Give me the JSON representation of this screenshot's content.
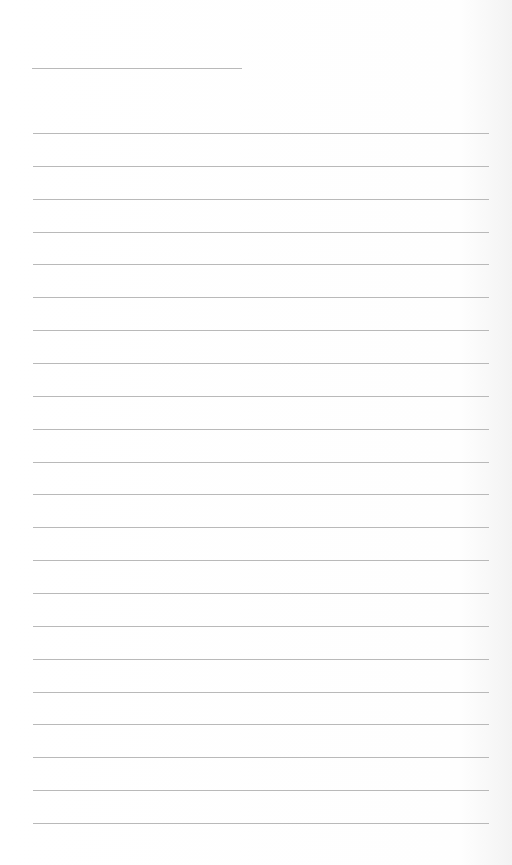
{
  "page": {
    "type": "blank lined paper",
    "header_line": {
      "label": ""
    },
    "ruled_lines_count": 22,
    "colors": {
      "background": "#ffffff",
      "line": "#b9b9b9"
    }
  }
}
